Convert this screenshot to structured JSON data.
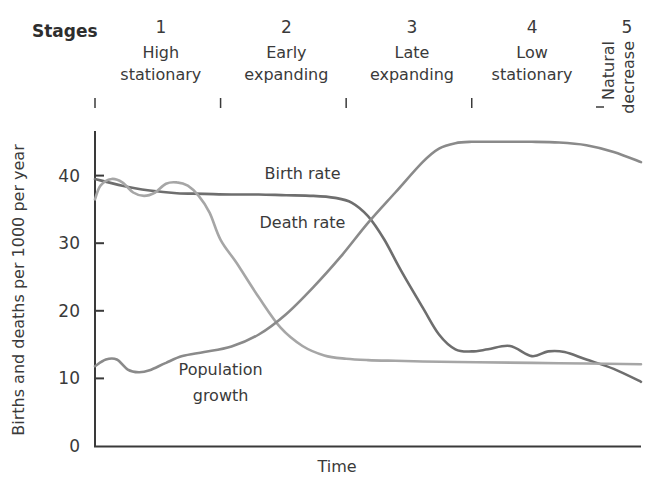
{
  "chart_data": {
    "type": "line",
    "title": "",
    "xlabel": "Time",
    "ylabel": "Births and deaths per 1000 per year",
    "ylim": [
      0,
      46
    ],
    "xlim": [
      0,
      100
    ],
    "yticks": [
      0,
      10,
      20,
      30,
      40
    ],
    "ytick_labels": [
      "0",
      "10",
      "20",
      "30",
      "40"
    ],
    "grid": false,
    "legend": "none (curves labelled inline)",
    "stages_title": "Stages",
    "stages": [
      {
        "number": "1",
        "label_lines": [
          "High",
          "stationary"
        ],
        "start": 0,
        "end": 23
      },
      {
        "number": "2",
        "label_lines": [
          "Early",
          "expanding"
        ],
        "start": 23,
        "end": 46
      },
      {
        "number": "3",
        "label_lines": [
          "Late",
          "expanding"
        ],
        "start": 46,
        "end": 69
      },
      {
        "number": "4",
        "label_lines": [
          "Low",
          "stationary"
        ],
        "start": 69,
        "end": 90
      },
      {
        "number": "5",
        "label_lines": [
          "Natural",
          "decrease"
        ],
        "start": 90,
        "end": 100
      }
    ],
    "series": [
      {
        "name": "Birth rate",
        "color": "#6e6e6e",
        "x": [
          0,
          5,
          10,
          15,
          20,
          25,
          30,
          35,
          40,
          44,
          47,
          50,
          53,
          56,
          60,
          63,
          66,
          69,
          72,
          76,
          80,
          83,
          86,
          90,
          95,
          100
        ],
        "y": [
          39.5,
          38.5,
          37.8,
          37.4,
          37.3,
          37.2,
          37.2,
          37.1,
          37.0,
          36.7,
          36.0,
          34.0,
          30.5,
          26.0,
          20.5,
          16.5,
          14.3,
          14.0,
          14.3,
          14.8,
          13.3,
          14.0,
          13.9,
          12.8,
          11.4,
          9.5
        ]
      },
      {
        "name": "Death rate",
        "color": "#a6a6a6",
        "x": [
          0,
          1,
          3,
          5,
          7,
          9,
          11,
          13,
          15,
          17,
          19,
          21,
          23,
          26,
          30,
          34,
          38,
          42,
          46,
          50,
          55,
          60,
          70,
          80,
          90,
          100
        ],
        "y": [
          36.5,
          38.5,
          39.5,
          39.0,
          37.5,
          37.0,
          37.5,
          38.8,
          39.0,
          38.5,
          37.0,
          34.5,
          30.5,
          27.0,
          22.0,
          17.5,
          14.8,
          13.4,
          12.9,
          12.7,
          12.6,
          12.5,
          12.4,
          12.3,
          12.2,
          12.1
        ]
      },
      {
        "name": "Population growth",
        "color": "#8a8a8a",
        "x": [
          0,
          2,
          4,
          6,
          8,
          10,
          13,
          16,
          20,
          25,
          30,
          35,
          40,
          45,
          50,
          55,
          60,
          63,
          66,
          69,
          72,
          76,
          80,
          85,
          90,
          95,
          100
        ],
        "y": [
          11.8,
          12.8,
          12.8,
          11.3,
          10.9,
          11.2,
          12.3,
          13.3,
          13.9,
          14.7,
          16.5,
          19.5,
          23.5,
          28.0,
          33.0,
          37.5,
          42.0,
          44.0,
          44.8,
          45.0,
          45.0,
          45.0,
          45.0,
          44.9,
          44.5,
          43.5,
          42.0
        ]
      }
    ],
    "annotations": [
      {
        "text": "Birth rate",
        "x": 38,
        "y": 39.5
      },
      {
        "text": "Death rate",
        "x": 38,
        "y": 32.2
      },
      {
        "text": "Population growth",
        "x": 23,
        "y": 10.5
      }
    ]
  }
}
